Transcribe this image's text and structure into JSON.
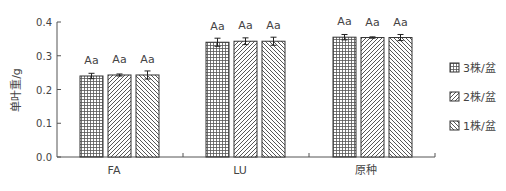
{
  "chart_data": {
    "type": "bar",
    "title": "",
    "xlabel": "",
    "ylabel": "单叶重/g",
    "ylim": [
      0,
      0.4
    ],
    "yticks": [
      "0.0",
      "0.1",
      "0.2",
      "0.3",
      "0.4"
    ],
    "grid": false,
    "legend_position": "right",
    "categories": [
      "FA",
      "LU",
      "原种"
    ],
    "series": [
      {
        "name": "3株/盆",
        "pattern": "grid",
        "values": [
          0.24,
          0.34,
          0.355
        ],
        "errors": [
          0.008,
          0.012,
          0.008
        ],
        "labels": [
          "Aa",
          "Aa",
          "Aa"
        ]
      },
      {
        "name": "2株/盆",
        "pattern": "diag-right",
        "values": [
          0.243,
          0.343,
          0.354
        ],
        "errors": [
          0.003,
          0.01,
          0.002
        ],
        "labels": [
          "Aa",
          "Aa",
          "Aa"
        ]
      },
      {
        "name": "1株/盆",
        "pattern": "diag-left",
        "values": [
          0.243,
          0.343,
          0.354
        ],
        "errors": [
          0.012,
          0.012,
          0.009
        ],
        "labels": [
          "Aa",
          "Aa",
          "Aa"
        ]
      }
    ]
  }
}
